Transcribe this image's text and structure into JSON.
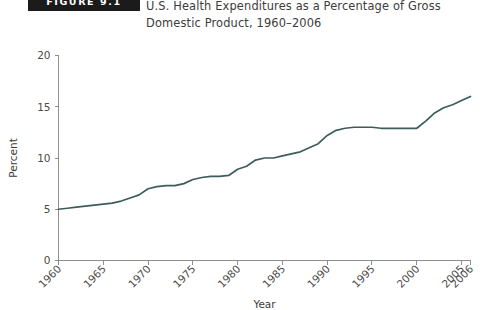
{
  "figure": {
    "badge": "FIGURE 9.1",
    "title_line1": "U.S. Health Expenditures as a Percentage of Gross",
    "title_line2": "Domestic Product, 1960–2006"
  },
  "colors": {
    "line": "#3d5c5c",
    "axis": "#8e8e8e",
    "badge_bg": "#1b1b1b",
    "text": "#3c3c3c",
    "background": "#ffffff"
  },
  "chart_data": {
    "type": "line",
    "title": "U.S. Health Expenditures as a Percentage of Gross Domestic Product, 1960–2006",
    "xlabel": "Year",
    "ylabel": "Percent",
    "xlim": [
      1960,
      2006
    ],
    "ylim": [
      0,
      20
    ],
    "grid": false,
    "legend": "none",
    "xticks": [
      1960,
      1965,
      1970,
      1975,
      1980,
      1985,
      1990,
      1995,
      2000,
      2005,
      2006
    ],
    "xtick_labels": [
      "1960",
      "1965",
      "1970",
      "1975",
      "1980",
      "1985",
      "1990",
      "1995",
      "2000",
      "2005",
      "2006"
    ],
    "xtick_rotation": 45,
    "yticks": [
      0,
      5,
      10,
      15,
      20
    ],
    "ytick_labels": [
      "0",
      "5",
      "10",
      "15",
      "20"
    ],
    "series": [
      {
        "name": "U.S. health expenditures (% of GDP)",
        "color": "#3d5c5c",
        "x": [
          1960,
          1961,
          1962,
          1963,
          1964,
          1965,
          1966,
          1967,
          1968,
          1969,
          1970,
          1971,
          1972,
          1973,
          1974,
          1975,
          1976,
          1977,
          1978,
          1979,
          1980,
          1981,
          1982,
          1983,
          1984,
          1985,
          1986,
          1987,
          1988,
          1989,
          1990,
          1991,
          1992,
          1993,
          1994,
          1995,
          1996,
          1997,
          1998,
          1999,
          2000,
          2001,
          2002,
          2003,
          2004,
          2005,
          2006
        ],
        "values": [
          5.0,
          5.1,
          5.2,
          5.3,
          5.4,
          5.5,
          5.6,
          5.8,
          6.1,
          6.4,
          7.0,
          7.2,
          7.3,
          7.3,
          7.5,
          7.9,
          8.1,
          8.2,
          8.2,
          8.3,
          8.9,
          9.2,
          9.8,
          10.0,
          10.0,
          10.2,
          10.4,
          10.6,
          11.0,
          11.4,
          12.2,
          12.7,
          12.9,
          13.0,
          13.0,
          13.0,
          12.9,
          12.9,
          12.9,
          12.9,
          12.9,
          13.6,
          14.4,
          14.9,
          15.2,
          15.6,
          16.0
        ]
      }
    ]
  }
}
